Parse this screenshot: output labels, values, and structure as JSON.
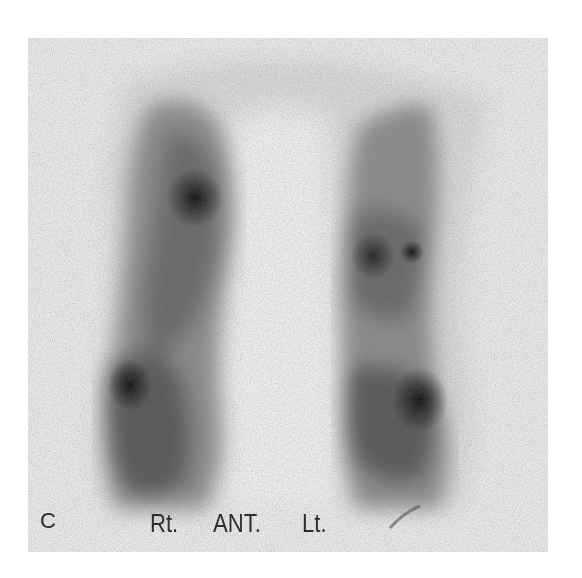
{
  "figure": {
    "panel_letter": "C",
    "view_labels": {
      "right": "Rt.",
      "view": "ANT.",
      "left": "Lt."
    }
  },
  "colors": {
    "page_background": "#ffffff",
    "frame_background": "#e9e9e9",
    "body_outline": "#d6d6d6",
    "uptake_mid": "#8a8a8a",
    "uptake_dark": "#3a3a3a",
    "hotspot": "#1a1a1a",
    "label_text": "#2e2e2e"
  }
}
